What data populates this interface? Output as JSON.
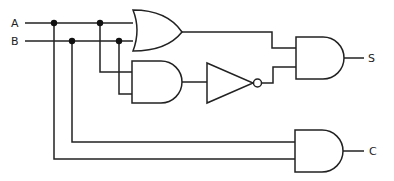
{
  "diagram": {
    "inputs": [
      {
        "id": "A",
        "label": "A"
      },
      {
        "id": "B",
        "label": "B"
      }
    ],
    "outputs": [
      {
        "id": "S",
        "label": "S"
      },
      {
        "id": "C",
        "label": "C"
      }
    ],
    "gates": [
      {
        "id": "or1",
        "type": "OR",
        "inputs": [
          "A",
          "B"
        ],
        "output": "or1"
      },
      {
        "id": "and1",
        "type": "AND",
        "inputs": [
          "A",
          "B"
        ],
        "output": "and1"
      },
      {
        "id": "not1",
        "type": "NOT",
        "inputs": [
          "and1"
        ],
        "output": "not1"
      },
      {
        "id": "and_s",
        "type": "AND",
        "inputs": [
          "or1",
          "not1"
        ],
        "output": "S"
      },
      {
        "id": "and_c",
        "type": "AND",
        "inputs": [
          "B",
          "A"
        ],
        "output": "C"
      }
    ],
    "colors": {
      "stroke": "#222222",
      "background": "#ffffff"
    }
  }
}
